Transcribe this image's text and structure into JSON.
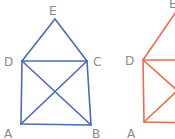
{
  "figures": [
    {
      "name": "house-figure-blue",
      "color": "#4a6bb5",
      "vertices": {
        "A": [
          21,
          124
        ],
        "B": [
          91,
          125
        ],
        "C": [
          87,
          61
        ],
        "D": [
          22,
          61
        ],
        "E": [
          55,
          19
        ]
      },
      "labels": {
        "A": {
          "text": "A",
          "x": 4,
          "y": 138
        },
        "B": {
          "text": "B",
          "x": 92,
          "y": 138
        },
        "C": {
          "text": "C",
          "x": 93,
          "y": 66
        },
        "D": {
          "text": "D",
          "x": 4,
          "y": 66
        },
        "E": {
          "text": "E",
          "x": 49,
          "y": 15
        }
      },
      "edges": [
        [
          "A",
          "B"
        ],
        [
          "B",
          "C"
        ],
        [
          "C",
          "D"
        ],
        [
          "D",
          "A"
        ],
        [
          "D",
          "E"
        ],
        [
          "E",
          "C"
        ],
        [
          "A",
          "C"
        ],
        [
          "D",
          "B"
        ]
      ]
    },
    {
      "name": "house-figure-red",
      "color": "#ee6a4e",
      "vertices": {
        "A": [
          144,
          122
        ],
        "B": [
          214,
          123
        ],
        "C": [
          210,
          60
        ],
        "D": [
          143,
          60
        ],
        "E": [
          176,
          12
        ]
      },
      "labels": {
        "A": {
          "text": "A",
          "x": 127,
          "y": 138
        },
        "D": {
          "text": "D",
          "x": 125,
          "y": 65
        },
        "E": {
          "text": "E",
          "x": 169,
          "y": 8
        }
      },
      "edges": [
        [
          "A",
          "B"
        ],
        [
          "B",
          "C"
        ],
        [
          "C",
          "D"
        ],
        [
          "D",
          "A"
        ],
        [
          "D",
          "E"
        ],
        [
          "E",
          "C"
        ],
        [
          "A",
          "C"
        ],
        [
          "D",
          "B"
        ]
      ]
    }
  ]
}
